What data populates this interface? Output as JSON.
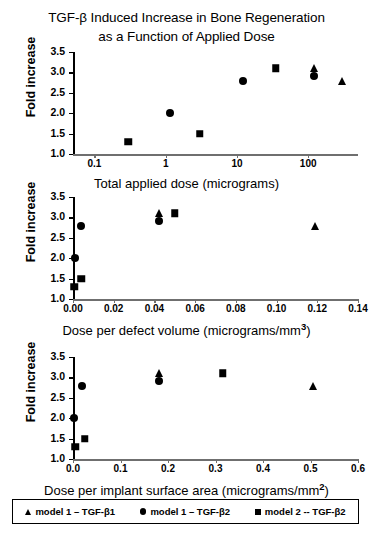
{
  "title": {
    "line1": "TGF-β Induced Increase in Bone Regeneration",
    "line2": "as a Function of Applied Dose"
  },
  "legend": {
    "items": [
      {
        "marker": "triangle",
        "label": "model 1 – TGF-β1"
      },
      {
        "marker": "circle",
        "label": "model 1 – TGF-β2"
      },
      {
        "marker": "square",
        "label": "model 2 -- TGF-β2"
      }
    ]
  },
  "chart_data": [
    {
      "type": "scatter",
      "panel": 1,
      "title": "",
      "xlabel": "Total applied dose (micrograms)",
      "ylabel": "Fold increase",
      "xscale": "log",
      "xlim": [
        0.05,
        500
      ],
      "ylim": [
        1.0,
        3.5
      ],
      "grid": false,
      "xticks": [
        0.1,
        1,
        10,
        100
      ],
      "xticklabels": [
        "0.1",
        "1",
        "10",
        "100"
      ],
      "yticks": [
        1.0,
        1.5,
        2.0,
        2.5,
        3.0,
        3.5
      ],
      "yticklabels": [
        "1.0",
        "1.5",
        "2.0",
        "2.5",
        "3.0",
        "3.5"
      ],
      "series": [
        {
          "name": "model 1 – TGF-β1",
          "marker": "triangle",
          "points": [
            {
              "x": 120,
              "y": 3.1
            },
            {
              "x": 300,
              "y": 2.8
            }
          ]
        },
        {
          "name": "model 1 – TGF-β2",
          "marker": "circle",
          "points": [
            {
              "x": 1.15,
              "y": 2.0
            },
            {
              "x": 12,
              "y": 2.8
            },
            {
              "x": 120,
              "y": 2.9
            }
          ]
        },
        {
          "name": "model 2 -- TGF-β2",
          "marker": "square",
          "points": [
            {
              "x": 0.3,
              "y": 1.3
            },
            {
              "x": 3.0,
              "y": 1.5
            },
            {
              "x": 35,
              "y": 3.1
            }
          ]
        }
      ]
    },
    {
      "type": "scatter",
      "panel": 2,
      "title": "",
      "xlabel": "Dose per defect volume (micrograms/mm3)",
      "xlabel_base": "Dose per defect volume (micrograms/mm",
      "xlabel_sup": "3",
      "xlabel_tail": ")",
      "ylabel": "Fold increase",
      "xscale": "linear",
      "xlim": [
        0.0,
        0.14
      ],
      "ylim": [
        1.0,
        3.5
      ],
      "grid": false,
      "xticks": [
        0.0,
        0.02,
        0.04,
        0.06,
        0.08,
        0.1,
        0.12,
        0.14
      ],
      "xticklabels": [
        "0.00",
        "0.02",
        "0.04",
        "0.06",
        "0.08",
        "0.10",
        "0.12",
        "0.14"
      ],
      "yticks": [
        1.0,
        1.5,
        2.0,
        2.5,
        3.0,
        3.5
      ],
      "yticklabels": [
        "1.0",
        "1.5",
        "2.0",
        "2.5",
        "3.0",
        "3.5"
      ],
      "series": [
        {
          "name": "model 1 – TGF-β1",
          "marker": "triangle",
          "points": [
            {
              "x": 0.042,
              "y": 3.1
            },
            {
              "x": 0.119,
              "y": 2.8
            }
          ]
        },
        {
          "name": "model 1 – TGF-β2",
          "marker": "circle",
          "points": [
            {
              "x": 0.001,
              "y": 2.0
            },
            {
              "x": 0.004,
              "y": 2.8
            },
            {
              "x": 0.042,
              "y": 2.9
            }
          ]
        },
        {
          "name": "model 2 -- TGF-β2",
          "marker": "square",
          "points": [
            {
              "x": 0.0005,
              "y": 1.3
            },
            {
              "x": 0.004,
              "y": 1.5
            },
            {
              "x": 0.05,
              "y": 3.1
            }
          ]
        }
      ]
    },
    {
      "type": "scatter",
      "panel": 3,
      "title": "",
      "xlabel": "Dose per implant surface area (micrograms/mm2)",
      "xlabel_base": "Dose per implant surface area (micrograms/mm",
      "xlabel_sup": "2",
      "xlabel_tail": ")",
      "ylabel": "Fold increase",
      "xscale": "linear",
      "xlim": [
        0.0,
        0.6
      ],
      "ylim": [
        1.0,
        3.5
      ],
      "grid": false,
      "xticks": [
        0.0,
        0.1,
        0.2,
        0.3,
        0.4,
        0.5,
        0.6
      ],
      "xticklabels": [
        "0.0",
        "0.1",
        "0.2",
        "0.3",
        "0.4",
        "0.5",
        "0.6"
      ],
      "yticks": [
        1.0,
        1.5,
        2.0,
        2.5,
        3.0,
        3.5
      ],
      "yticklabels": [
        "1.0",
        "1.5",
        "2.0",
        "2.5",
        "3.0",
        "3.5"
      ],
      "series": [
        {
          "name": "model 1 – TGF-β1",
          "marker": "triangle",
          "points": [
            {
              "x": 0.182,
              "y": 3.1
            },
            {
              "x": 0.505,
              "y": 2.8
            }
          ]
        },
        {
          "name": "model 1 – TGF-β2",
          "marker": "circle",
          "points": [
            {
              "x": 0.002,
              "y": 2.0
            },
            {
              "x": 0.018,
              "y": 2.8
            },
            {
              "x": 0.182,
              "y": 2.9
            }
          ]
        },
        {
          "name": "model 2 -- TGF-β2",
          "marker": "square",
          "points": [
            {
              "x": 0.005,
              "y": 1.3
            },
            {
              "x": 0.025,
              "y": 1.5
            },
            {
              "x": 0.315,
              "y": 3.1
            }
          ]
        }
      ]
    }
  ]
}
